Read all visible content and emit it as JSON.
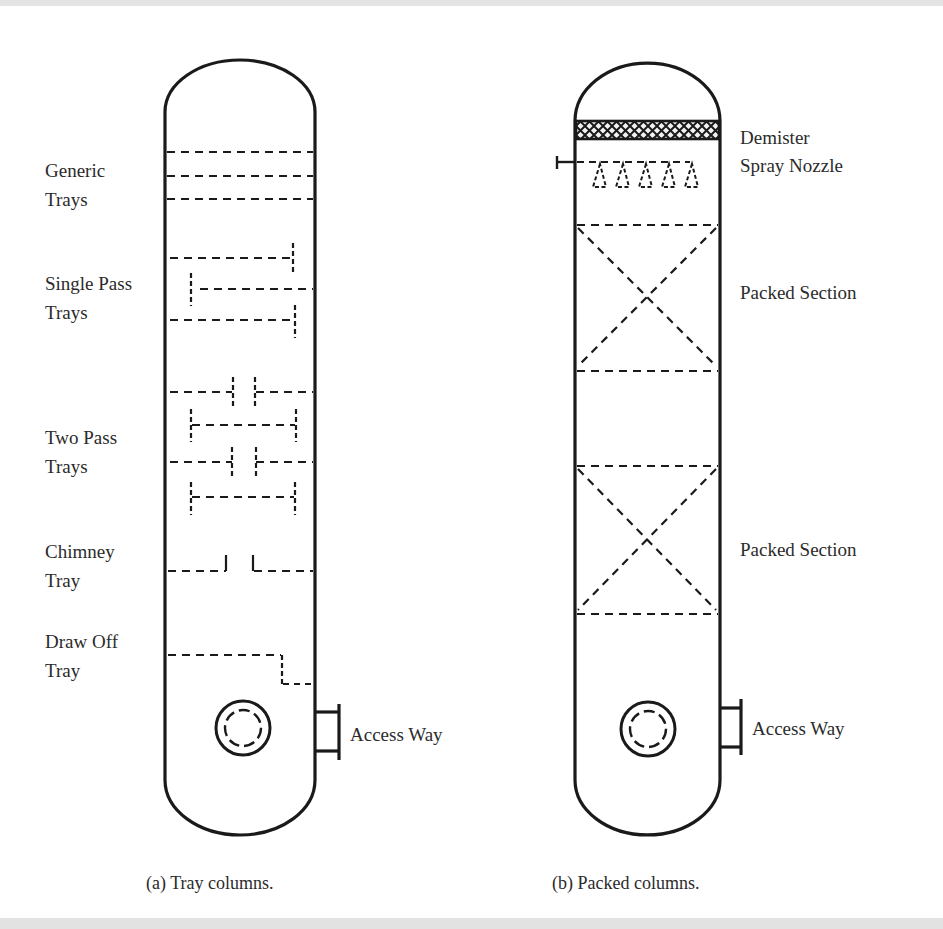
{
  "figure": {
    "panel_a": {
      "caption": "(a) Tray columns.",
      "labels": {
        "generic_trays_1": "Generic",
        "generic_trays_2": "Trays",
        "single_pass_1": "Single Pass",
        "single_pass_2": "Trays",
        "two_pass_1": "Two Pass",
        "two_pass_2": "Trays",
        "chimney_1": "Chimney",
        "chimney_2": "Tray",
        "draw_off_1": "Draw Off",
        "draw_off_2": "Tray",
        "access_way": "Access Way"
      }
    },
    "panel_b": {
      "caption": "(b) Packed columns.",
      "labels": {
        "demister": "Demister",
        "spray_nozzle": "Spray Nozzle",
        "packed_section_1": "Packed Section",
        "packed_section_2": "Packed Section",
        "access_way": "Access Way"
      }
    },
    "colors": {
      "line": "#1a1a1a",
      "dash": "#2a2a2a",
      "background": "#ffffff",
      "band": "#e3e3e3"
    }
  }
}
